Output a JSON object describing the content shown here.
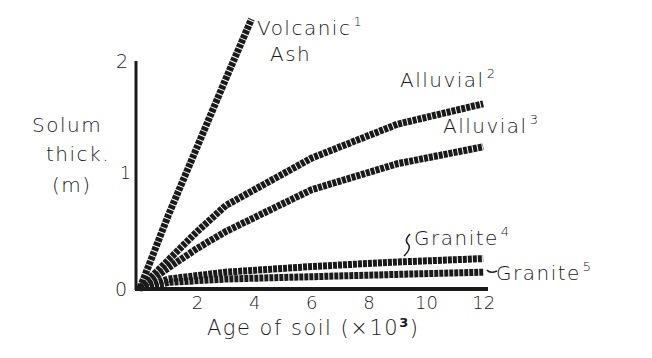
{
  "chart_data": {
    "type": "line",
    "title": "",
    "xlabel": "Age of soil (×10³)",
    "xlabel_parts": {
      "text": "Age of soil (×10",
      "sup": "3",
      "close": ")"
    },
    "ylabel": [
      "Solum",
      "thick.",
      "(m)"
    ],
    "xlim": [
      0,
      12
    ],
    "ylim": [
      0,
      2
    ],
    "x_ticks": [
      2,
      4,
      6,
      8,
      10,
      12
    ],
    "x_tick_labels": [
      "2",
      "4",
      "6",
      "8",
      "10",
      "12"
    ],
    "y_ticks": [
      0,
      1,
      2
    ],
    "y_tick_labels": [
      "0",
      "1",
      "2"
    ],
    "grid": false,
    "legend": "inline labels at line ends",
    "series": [
      {
        "name": "Volcanic Ash",
        "label": "Volcanic",
        "label2": "Ash",
        "sup": "1",
        "x": [
          0,
          1,
          2,
          3,
          3.9
        ],
        "y": [
          0,
          0.65,
          1.25,
          1.85,
          2.38
        ]
      },
      {
        "name": "Alluvial",
        "label": "Alluvial",
        "sup": "2",
        "x": [
          0,
          1,
          2,
          3,
          6,
          9,
          12
        ],
        "y": [
          0,
          0.25,
          0.5,
          0.73,
          1.15,
          1.45,
          1.63
        ]
      },
      {
        "name": "Alluvial",
        "label": "Alluvial",
        "sup": "3",
        "x": [
          0,
          1,
          2,
          3,
          6,
          9,
          12
        ],
        "y": [
          0,
          0.18,
          0.35,
          0.5,
          0.87,
          1.1,
          1.25
        ]
      },
      {
        "name": "Granite",
        "label": "Granite",
        "sup": "4",
        "x": [
          0,
          1,
          3,
          6,
          9,
          12
        ],
        "y": [
          0,
          0.08,
          0.14,
          0.19,
          0.23,
          0.26
        ]
      },
      {
        "name": "Granite",
        "label": "Granite",
        "sup": "5",
        "x": [
          0,
          1,
          3,
          6,
          9,
          12
        ],
        "y": [
          0,
          0.05,
          0.08,
          0.1,
          0.12,
          0.14
        ]
      }
    ]
  }
}
